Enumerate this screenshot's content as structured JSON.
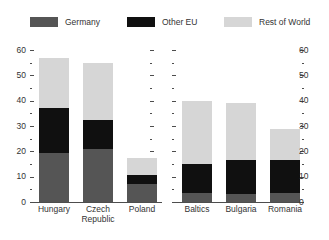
{
  "legend": {
    "items": [
      {
        "label": "Germany",
        "color": "#555555",
        "icon": "legend-swatch-germany"
      },
      {
        "label": "Other EU",
        "color": "#101010",
        "icon": "legend-swatch-other-eu"
      },
      {
        "label": "Rest of World",
        "color": "#d6d6d6",
        "icon": "legend-swatch-rest-of-world"
      }
    ]
  },
  "axes": {
    "left": {
      "ticks": [
        "0",
        "10",
        "20",
        "30",
        "40",
        "50",
        "60"
      ]
    },
    "right": {
      "ticks": [
        "0",
        "10",
        "20",
        "30",
        "40",
        "50",
        "60"
      ]
    },
    "inner_left": {
      "ticks": [
        "",
        "",
        "",
        "",
        "",
        "",
        ""
      ]
    },
    "inner_right": {
      "ticks": [
        "",
        "",
        "",
        "",
        "",
        "",
        ""
      ]
    }
  },
  "chart_data": {
    "type": "bar",
    "subtype": "stacked",
    "title": "",
    "subtitle": "",
    "xlabel": "",
    "ylabel": "",
    "ylim": [
      0,
      60
    ],
    "ytick_step": 10,
    "yminor_step": 5,
    "grid": false,
    "legend_position": "top",
    "panels": [
      {
        "name": "panel-left",
        "categories": [
          "Hungary",
          "Czech Republic",
          "Poland"
        ],
        "series": [
          {
            "name": "Germany",
            "color": "#555555",
            "values": [
              19.5,
              21.0,
              7.0
            ]
          },
          {
            "name": "Other EU",
            "color": "#101010",
            "values": [
              17.5,
              11.5,
              3.5
            ]
          },
          {
            "name": "Rest of World",
            "color": "#d6d6d6",
            "values": [
              20.0,
              22.5,
              7.0
            ]
          }
        ],
        "totals": [
          57.0,
          55.0,
          17.5
        ]
      },
      {
        "name": "panel-right",
        "categories": [
          "Baltics",
          "Bulgaria",
          "Romania"
        ],
        "series": [
          {
            "name": "Germany",
            "color": "#555555",
            "values": [
              3.5,
              3.0,
              3.5
            ]
          },
          {
            "name": "Other EU",
            "color": "#101010",
            "values": [
              11.5,
              13.5,
              13.0
            ]
          },
          {
            "name": "Rest of World",
            "color": "#d6d6d6",
            "values": [
              25.0,
              22.5,
              12.5
            ]
          }
        ],
        "totals": [
          40.0,
          39.0,
          29.0
        ]
      }
    ]
  }
}
